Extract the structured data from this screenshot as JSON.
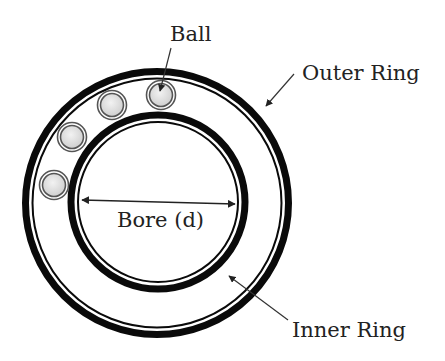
{
  "labels": {
    "ball": "Ball",
    "outer_ring": "Outer Ring",
    "inner_ring": "Inner Ring",
    "bore": "Bore (d)"
  },
  "colors": {
    "ring": "#0a0a0a",
    "ball_fill": "#dcdcdc",
    "ball_stroke": "#555555",
    "text": "#222222",
    "arrow": "#333333",
    "background": "#ffffff"
  },
  "geometry": {
    "outer_ring": {
      "cx": 157,
      "cy": 203,
      "band_outer_r": 135,
      "band_inner_r": 128,
      "thin_r": 125
    },
    "inner_ring": {
      "cx": 158,
      "cy": 202,
      "band_outer_r": 90,
      "band_inner_r": 84,
      "thin_r": 80
    },
    "balls": [
      {
        "cx": 161,
        "cy": 95,
        "r": 14
      },
      {
        "cx": 112,
        "cy": 105,
        "r": 14
      },
      {
        "cx": 72,
        "cy": 137,
        "r": 14
      },
      {
        "cx": 54,
        "cy": 185,
        "r": 14
      }
    ]
  }
}
